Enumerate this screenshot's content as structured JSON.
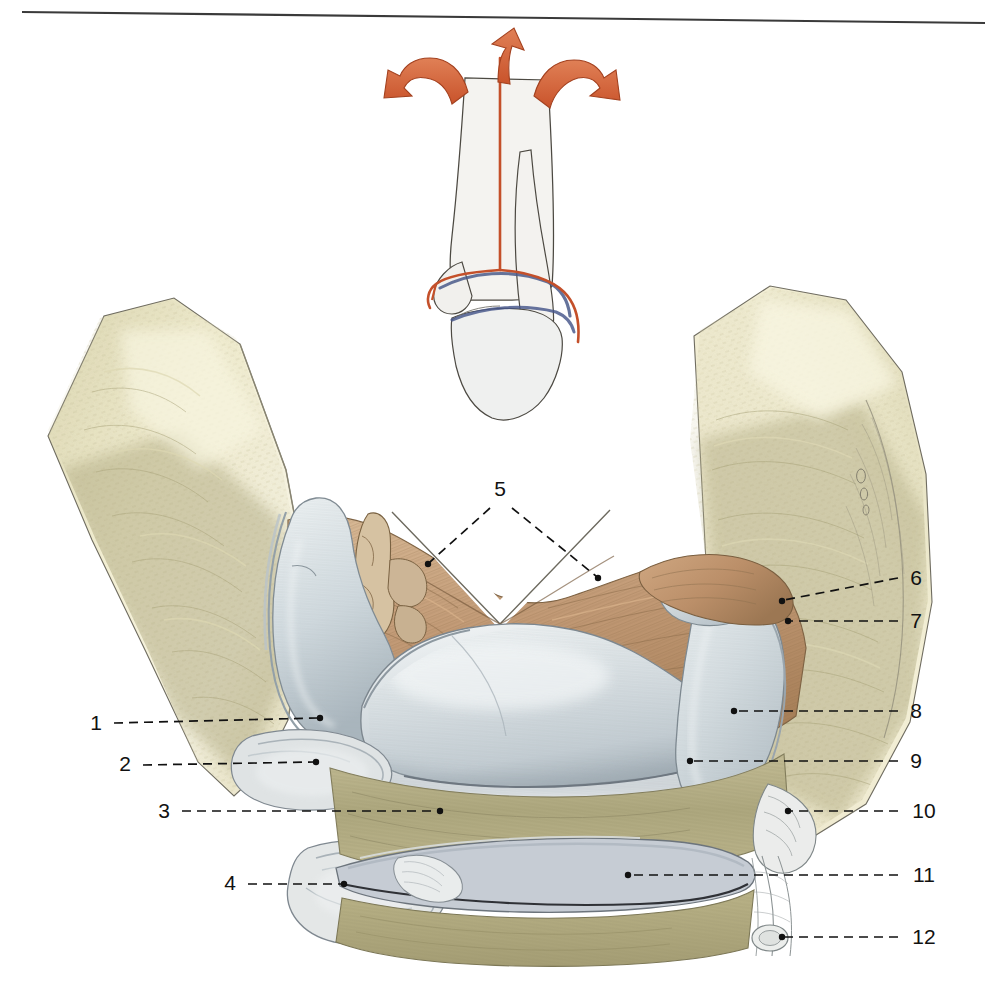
{
  "plate": {
    "kind": "anatomical-illustration",
    "title": "Opened ankle joint (talocrural joint), anterior view of articular surfaces",
    "background_color": "#ffffff",
    "top_rule": {
      "present": true,
      "color": "#3a3a3a"
    }
  },
  "orientation_diagram": {
    "name": "orientation-inset",
    "description": "Small skeletal inset of distal tibia, fibula and talus showing the book-opening plane of section",
    "arrow_color": "#d2643c",
    "cut_line_color": "#c4502a",
    "cartilage_line_color": "#4a5a8a",
    "bone_fill": "#f3f2ef",
    "bone_outline": "#4a4740",
    "arrows": [
      {
        "name": "open-arrow-left",
        "direction": "left"
      },
      {
        "name": "open-arrow-center",
        "direction": "up"
      },
      {
        "name": "open-arrow-right",
        "direction": "right"
      }
    ]
  },
  "palette": {
    "cartilage": "#ccd5d9",
    "cartilage_shadow": "#aab6bd",
    "cartilage_edge": "#8d9aa2",
    "cancellous_bone": "#efe9cc",
    "cancellous_bone_dark": "#cdc9a3",
    "muscle_olive": "#b6b089",
    "muscle_olive_dark": "#9a9470",
    "ligament_tan": "#c9a684",
    "ligament_tan_dark": "#a88360",
    "synovium": "#e6e4dd",
    "ink": "#5d5a52"
  },
  "labels": {
    "side_left": [
      {
        "id": "1",
        "text": "1",
        "side": "left"
      },
      {
        "id": "2",
        "text": "2",
        "side": "left"
      },
      {
        "id": "3",
        "text": "3",
        "side": "left"
      },
      {
        "id": "4",
        "text": "4",
        "side": "left"
      }
    ],
    "top_center": [
      {
        "id": "5",
        "text": "5",
        "side": "top",
        "branches": 2
      }
    ],
    "side_right": [
      {
        "id": "6",
        "text": "6",
        "side": "right"
      },
      {
        "id": "7",
        "text": "7",
        "side": "right"
      },
      {
        "id": "8",
        "text": "8",
        "side": "right"
      },
      {
        "id": "9",
        "text": "9",
        "side": "right"
      },
      {
        "id": "10",
        "text": "10",
        "side": "right"
      },
      {
        "id": "11",
        "text": "11",
        "side": "right"
      },
      {
        "id": "12",
        "text": "12",
        "side": "right"
      }
    ]
  },
  "label_values": {
    "l1": "1",
    "l2": "2",
    "l3": "3",
    "l4": "4",
    "l5": "5",
    "l6": "6",
    "l7": "7",
    "l8": "8",
    "l9": "9",
    "l10": "10",
    "l11": "11",
    "l12": "12"
  }
}
